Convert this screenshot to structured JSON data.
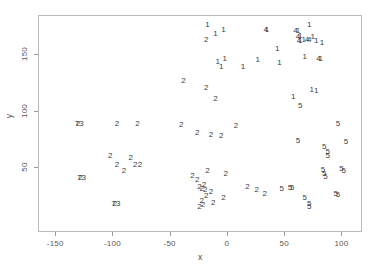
{
  "chart_data": {
    "type": "scatter",
    "title": "",
    "xlabel": "x",
    "ylabel": "y",
    "xlim": [
      -165,
      118
    ],
    "ylim": [
      -8,
      185
    ],
    "xticks": [
      -150,
      -100,
      -50,
      0,
      50,
      100
    ],
    "xticklabels": [
      "-150",
      "-100",
      "-50",
      "0",
      "50",
      "100"
    ],
    "yticks": [
      50,
      100,
      150
    ],
    "yticklabels": [
      "50",
      "100",
      "150"
    ],
    "grid": false,
    "legend": null,
    "marker_style": "cluster-id-digit-text",
    "series": [
      {
        "name": "cluster-1",
        "label": "1",
        "points": [
          [
            -17,
            176
          ],
          [
            -10,
            168
          ],
          [
            -3,
            172
          ],
          [
            35,
            172
          ],
          [
            62,
            171
          ],
          [
            64,
            166
          ],
          [
            64,
            162
          ],
          [
            67,
            163
          ],
          [
            72,
            176
          ],
          [
            75,
            165
          ],
          [
            78,
            162
          ],
          [
            83,
            160
          ],
          [
            44,
            155
          ],
          [
            27,
            145
          ],
          [
            -8,
            143
          ],
          [
            -5,
            139
          ],
          [
            -2,
            146
          ],
          [
            14,
            139
          ],
          [
            46,
            142
          ],
          [
            68,
            148
          ],
          [
            82,
            146
          ],
          [
            74,
            118
          ],
          [
            78,
            117
          ],
          [
            58,
            112
          ]
        ]
      },
      {
        "name": "cluster-4",
        "label": "4",
        "points": [
          [
            34,
            172
          ],
          [
            60,
            171
          ],
          [
            62,
            165
          ],
          [
            63,
            162
          ],
          [
            70,
            163
          ],
          [
            72,
            163
          ],
          [
            80,
            146
          ]
        ]
      },
      {
        "name": "cluster-2",
        "label": "2",
        "points": [
          [
            -18,
            163
          ],
          [
            -38,
            126
          ],
          [
            -18,
            120
          ],
          [
            -10,
            110
          ],
          [
            -130,
            88
          ],
          [
            -96,
            88
          ],
          [
            -78,
            88
          ],
          [
            -40,
            87
          ],
          [
            -26,
            80
          ],
          [
            -14,
            78
          ],
          [
            -5,
            77
          ],
          [
            8,
            86
          ],
          [
            -102,
            60
          ],
          [
            -96,
            52
          ],
          [
            -90,
            46
          ],
          [
            -84,
            58
          ],
          [
            -80,
            52
          ],
          [
            -76,
            52
          ],
          [
            -128,
            40
          ],
          [
            -98,
            17
          ],
          [
            -30,
            42
          ],
          [
            -26,
            38
          ],
          [
            -24,
            32
          ],
          [
            -22,
            30
          ],
          [
            -20,
            34
          ],
          [
            -19,
            29
          ],
          [
            -18,
            24
          ],
          [
            -22,
            20
          ],
          [
            -21,
            16
          ],
          [
            -24,
            14
          ],
          [
            -17,
            46
          ],
          [
            -14,
            28
          ],
          [
            -12,
            18
          ],
          [
            -1,
            44
          ],
          [
            -3,
            22
          ],
          [
            18,
            32
          ],
          [
            26,
            29
          ],
          [
            33,
            26
          ]
        ]
      },
      {
        "name": "cluster-7",
        "label": "7",
        "points": [
          [
            -131,
            88
          ],
          [
            -129,
            40
          ],
          [
            -99,
            17
          ]
        ]
      },
      {
        "name": "cluster-3",
        "label": "3",
        "points": [
          [
            -127,
            88
          ],
          [
            -125,
            40
          ],
          [
            -95,
            17
          ]
        ]
      },
      {
        "name": "cluster-5",
        "label": "5",
        "points": [
          [
            64,
            104
          ],
          [
            97,
            88
          ],
          [
            62,
            73
          ],
          [
            85,
            68
          ],
          [
            88,
            63
          ],
          [
            88,
            60
          ],
          [
            104,
            72
          ],
          [
            84,
            47
          ],
          [
            85,
            44
          ],
          [
            86,
            41
          ],
          [
            100,
            48
          ],
          [
            102,
            46
          ],
          [
            48,
            30
          ],
          [
            55,
            31
          ],
          [
            57,
            31
          ],
          [
            68,
            22
          ],
          [
            72,
            17
          ],
          [
            72,
            14
          ],
          [
            95,
            26
          ],
          [
            97,
            25
          ]
        ]
      }
    ]
  }
}
